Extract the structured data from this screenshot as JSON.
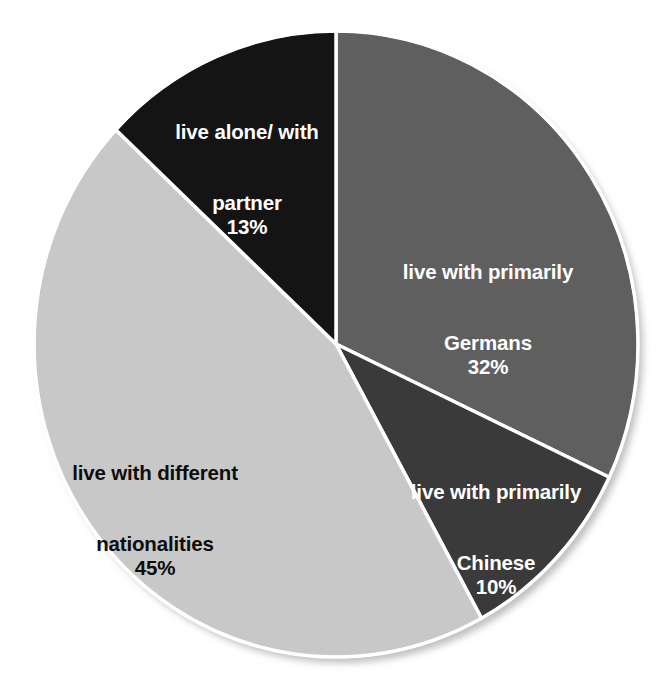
{
  "chart_data": {
    "type": "pie",
    "title": "",
    "subtitle": "",
    "xlabel": "",
    "ylabel": "",
    "grid": false,
    "legend": "none",
    "labels_inside_slices": true,
    "start_angle_deg": 0,
    "direction": "clockwise",
    "units": "%",
    "categories": [
      "live with primarily Germans",
      "live with primarily Chinese",
      "live with different nationalities",
      "live alone/ with partner"
    ],
    "values": [
      32,
      10,
      45,
      13
    ],
    "total": 100,
    "slices": [
      {
        "name": "live with primarily Germans",
        "label_line1": "live with primarily",
        "label_line2": "Germans",
        "value": 32,
        "value_text": "32%",
        "color": "#5f5f5f",
        "text_color": "#ffffff",
        "start_deg": 0,
        "end_deg": 115.2
      },
      {
        "name": "live with primarily Chinese",
        "label_line1": "live with primarily",
        "label_line2": "Chinese",
        "value": 10,
        "value_text": "10%",
        "color": "#3a3a3a",
        "text_color": "#ffffff",
        "start_deg": 115.2,
        "end_deg": 151.2
      },
      {
        "name": "live with different nationalities",
        "label_line1": "live with different",
        "label_line2": "nationalities",
        "value": 45,
        "value_text": "45%",
        "color": "#c8c8c8",
        "text_color": "#0d0d0d",
        "start_deg": 151.2,
        "end_deg": 313.2
      },
      {
        "name": "live alone/ with partner",
        "label_line1": "live alone/ with",
        "label_line2": "partner",
        "value": 13,
        "value_text": "13%",
        "color": "#141414",
        "text_color": "#ffffff",
        "start_deg": 313.2,
        "end_deg": 360
      }
    ],
    "separator_color": "#ffffff",
    "background_color": "#ffffff"
  },
  "labels": {
    "germans": {
      "line1": "live with primarily",
      "line2": "Germans",
      "pct": "32%"
    },
    "chinese": {
      "line1": "live with primarily",
      "line2": "Chinese",
      "pct": "10%"
    },
    "nationalities": {
      "line1": "live with different",
      "line2": "nationalities",
      "pct": "45%"
    },
    "alone": {
      "line1": "live alone/ with",
      "line2": "partner",
      "pct": "13%"
    }
  }
}
